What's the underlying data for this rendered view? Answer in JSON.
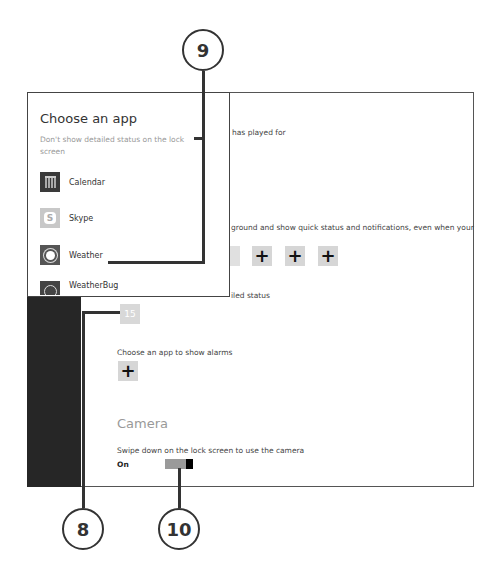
{
  "settings": {
    "partial_text_top": "has played for",
    "background_apps_text": "ground and show quick status and notifications, even when your",
    "detailed_status_text": "iled status",
    "alarms_label": "Choose an app to show alarms",
    "add_symbol": "+",
    "detail_app_glyph": "15",
    "camera": {
      "title": "Camera",
      "description": "Swipe down on the lock screen to use the camera",
      "state": "On"
    }
  },
  "popup": {
    "title": "Choose an app",
    "description": "Don't show detailed status on the lock screen",
    "apps": [
      {
        "label": "Calendar",
        "icon": "calendar-icon"
      },
      {
        "label": "Skype",
        "icon": "skype-icon",
        "glyph": "S"
      },
      {
        "label": "Weather",
        "icon": "weather-icon"
      },
      {
        "label": "WeatherBug",
        "icon": "weatherbug-icon"
      }
    ]
  },
  "callouts": [
    {
      "number": "9"
    },
    {
      "number": "8"
    },
    {
      "number": "10"
    }
  ]
}
